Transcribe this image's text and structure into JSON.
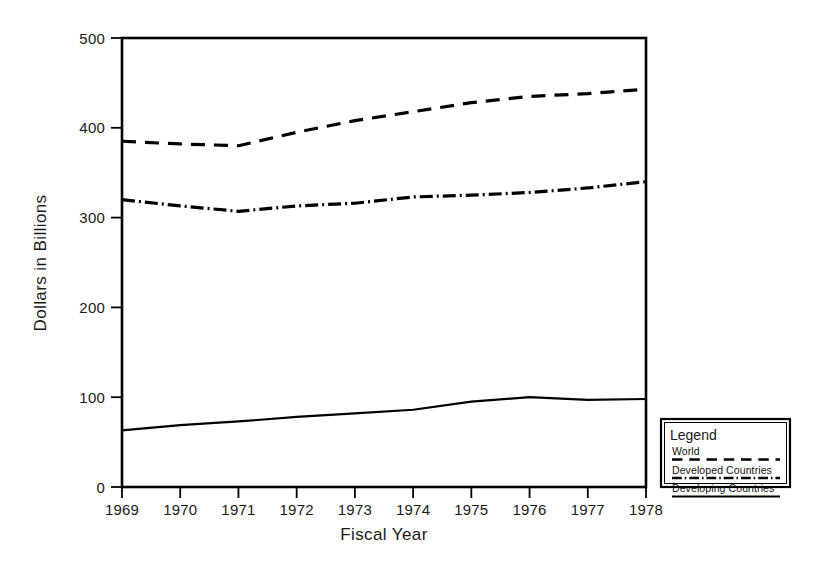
{
  "chart_data": {
    "type": "line",
    "title": "",
    "xlabel": "Fiscal Year",
    "ylabel": "Dollars in Billions",
    "x": [
      1969,
      1970,
      1971,
      1972,
      1973,
      1974,
      1975,
      1976,
      1977,
      1978
    ],
    "categories": [
      "1969",
      "1970",
      "1971",
      "1972",
      "1973",
      "1974",
      "1975",
      "1976",
      "1977",
      "1978"
    ],
    "xlim": [
      1969,
      1978
    ],
    "ylim": [
      0,
      500
    ],
    "yticks": [
      0,
      100,
      200,
      300,
      400,
      500
    ],
    "ytick_labels": [
      "0",
      "100",
      "200",
      "300",
      "400",
      "500"
    ],
    "xticks": [
      1969,
      1970,
      1971,
      1972,
      1973,
      1974,
      1975,
      1976,
      1977,
      1978
    ],
    "grid": false,
    "legend_position": "outside-bottom-right",
    "series": [
      {
        "name": "World",
        "style": "dashed",
        "color": "#000000",
        "values": [
          385,
          382,
          380,
          395,
          408,
          418,
          428,
          435,
          438,
          443
        ]
      },
      {
        "name": "Developed Countries",
        "style": "dash-dot",
        "color": "#000000",
        "values": [
          320,
          313,
          307,
          313,
          316,
          323,
          325,
          328,
          333,
          340
        ]
      },
      {
        "name": "Developing Countries",
        "style": "solid",
        "color": "#000000",
        "values": [
          63,
          69,
          73,
          78,
          82,
          86,
          95,
          100,
          97,
          98
        ]
      }
    ]
  },
  "legend": {
    "title": "Legend",
    "items": [
      {
        "label": "World",
        "style": "dashed"
      },
      {
        "label": "Developed Countries",
        "style": "dash-dot"
      },
      {
        "label": "Developing Countries",
        "style": "solid"
      }
    ]
  },
  "axes": {
    "x_title": "Fiscal Year",
    "y_title": "Dollars in Billions"
  }
}
